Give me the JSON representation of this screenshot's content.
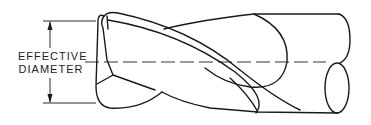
{
  "figure": {
    "dimension_label": {
      "line1": "EFFECTIVE",
      "line2": "DIAMETER"
    },
    "colors": {
      "line": "#1a1a1a",
      "background": "#ffffff"
    }
  }
}
